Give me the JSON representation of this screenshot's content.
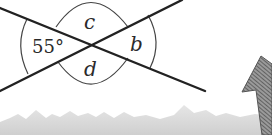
{
  "diagram": {
    "type": "intersecting-lines-angles",
    "labels": {
      "left_angle": "55°",
      "top_angle": "c",
      "right_angle": "b",
      "bottom_angle": "d"
    },
    "colors": {
      "line": "#222222",
      "arc": "#444444",
      "ground": "#d9d9d9",
      "arrow": "#666666"
    }
  }
}
